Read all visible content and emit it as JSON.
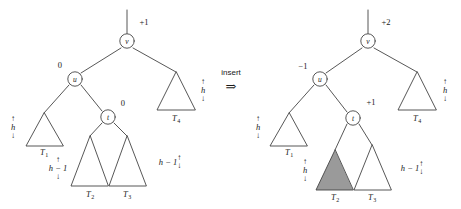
{
  "figure": {
    "caption": "AVL tree rebalancing: insertion into subtree T2 changes balance factors",
    "operation": {
      "label": "insert",
      "arrow": "⇒"
    },
    "colors": {
      "stroke": "#444444",
      "text": "#1a1a1a",
      "shaded_fill": "#9a9a9a",
      "background": "#ffffff"
    },
    "trees": [
      {
        "id": "before",
        "nodes": [
          {
            "name": "v",
            "balance": "+1"
          },
          {
            "name": "u",
            "balance": "0"
          },
          {
            "name": "t",
            "balance": "0"
          }
        ],
        "subtrees": [
          {
            "name": "T",
            "index": "1",
            "height": "h",
            "shaded": false
          },
          {
            "name": "T",
            "index": "2",
            "height": "h − 1",
            "shaded": false
          },
          {
            "name": "T",
            "index": "3",
            "height": "h − 1",
            "shaded": false
          },
          {
            "name": "T",
            "index": "4",
            "height": "h",
            "shaded": false
          }
        ]
      },
      {
        "id": "after",
        "nodes": [
          {
            "name": "v",
            "balance": "+2"
          },
          {
            "name": "u",
            "balance": "−1"
          },
          {
            "name": "t",
            "balance": "+1"
          }
        ],
        "subtrees": [
          {
            "name": "T",
            "index": "1",
            "height": "h",
            "shaded": false
          },
          {
            "name": "T",
            "index": "2",
            "height": "h",
            "shaded": true
          },
          {
            "name": "T",
            "index": "3",
            "height": "h − 1",
            "shaded": false
          },
          {
            "name": "T",
            "index": "4",
            "height": "h",
            "shaded": false
          }
        ]
      }
    ],
    "arrows": {
      "up": "↑",
      "down": "↓"
    }
  }
}
